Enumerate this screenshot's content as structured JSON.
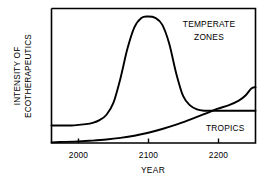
{
  "chart_data": {
    "type": "line",
    "title": "",
    "xlabel": "YEAR",
    "ylabel_line1": "INTENSITY OF",
    "ylabel_line2": "ECOTHERAPEUTICS",
    "xlim": [
      1961,
      2254
    ],
    "ylim": [
      0,
      100
    ],
    "xticks": [
      2000,
      2100,
      2200
    ],
    "xtick_labels": [
      "2000",
      "2100",
      "2200"
    ],
    "yticks": [],
    "ytick_labels": [],
    "grid": false,
    "legend": "inline-annotations",
    "line_color": "#000000",
    "axis_color": "#000000",
    "background_color": "#ffffff",
    "series": [
      {
        "name": "TEMPERATE ZONES",
        "annotation_line1": "TEMPERATE",
        "annotation_line2": "ZONES",
        "x": [
          1961,
          1975,
          1990,
          2000,
          2010,
          2020,
          2030,
          2040,
          2050,
          2060,
          2070,
          2080,
          2090,
          2100,
          2110,
          2120,
          2130,
          2140,
          2150,
          2160,
          2170,
          2180,
          2190,
          2200,
          2220,
          2240,
          2254
        ],
        "values": [
          13,
          13,
          13,
          13.5,
          14,
          15,
          17,
          21,
          30,
          48,
          70,
          86,
          93,
          94,
          93,
          88,
          74,
          52,
          35,
          28,
          25,
          24,
          24,
          24,
          24,
          24,
          24
        ]
      },
      {
        "name": "TROPICS",
        "annotation_line1": "TROPICS",
        "x": [
          1961,
          1980,
          2000,
          2020,
          2040,
          2060,
          2080,
          2100,
          2120,
          2140,
          2160,
          2180,
          2200,
          2215,
          2230,
          2240,
          2248,
          2254
        ],
        "values": [
          0.5,
          0.8,
          1.2,
          1.8,
          2.6,
          3.8,
          5.4,
          7.6,
          10.4,
          13.6,
          17.4,
          21.4,
          25.5,
          28.0,
          31.5,
          35.5,
          40.5,
          41.5
        ]
      }
    ]
  },
  "annotations": {
    "temperate": {
      "line1": "TEMPERATE",
      "line2": "ZONES"
    },
    "tropics": {
      "line1": "TROPICS"
    }
  },
  "axes": {
    "x_title": "YEAR",
    "y_title_line1": "INTENSITY OF",
    "y_title_line2": "ECOTHERAPEUTICS",
    "x_tick_labels": [
      "2000",
      "2100",
      "2200"
    ]
  }
}
